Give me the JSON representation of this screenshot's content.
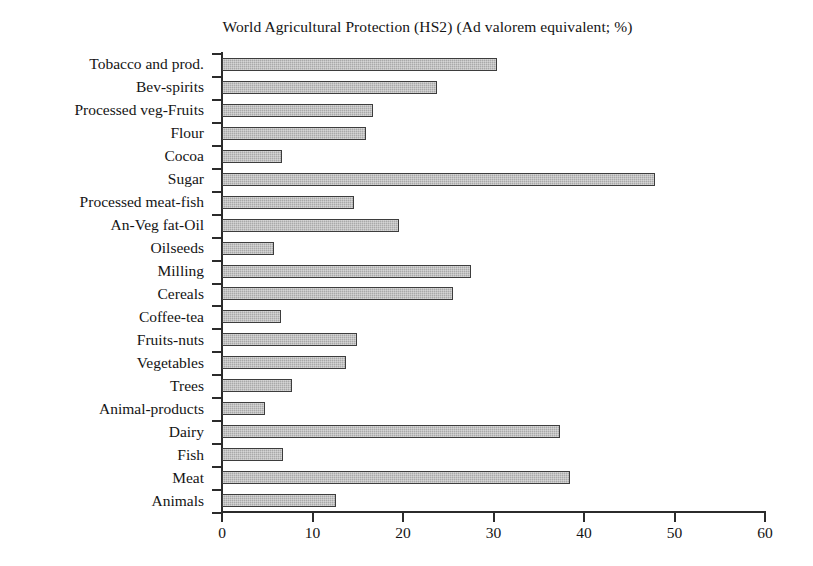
{
  "chart_data": {
    "type": "bar",
    "orientation": "horizontal",
    "title": "World Agricultural Protection (HS2) (Ad valorem equivalent; %)",
    "xlabel": "",
    "ylabel": "",
    "xlim": [
      0,
      60
    ],
    "xticks": [
      0,
      10,
      20,
      30,
      40,
      50,
      60
    ],
    "grid": false,
    "legend": null,
    "bar_color": "#a9a9a9",
    "bar_edge_color": "#3d3d3d",
    "categories": [
      "Tobacco and prod.",
      "Bev-spirits",
      "Processed veg-Fruits",
      "Flour",
      "Cocoa",
      "Sugar",
      "Processed meat-fish",
      "An-Veg fat-Oil",
      "Oilseeds",
      "Milling",
      "Cereals",
      "Coffee-tea",
      "Fruits-nuts",
      "Vegetables",
      "Trees",
      "Animal-products",
      "Dairy",
      "Fish",
      "Meat",
      "Animals"
    ],
    "values": [
      30.4,
      23.8,
      16.7,
      15.9,
      6.6,
      47.8,
      14.6,
      19.6,
      5.8,
      27.5,
      25.5,
      6.5,
      14.9,
      13.7,
      7.7,
      4.8,
      37.4,
      6.7,
      38.5,
      12.6
    ]
  }
}
